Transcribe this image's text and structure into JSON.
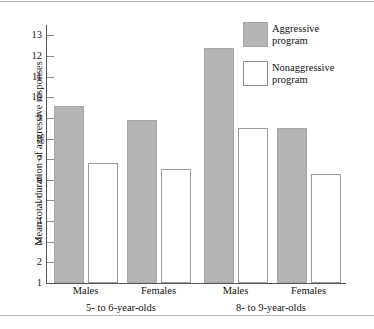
{
  "chart_data": {
    "type": "bar",
    "title": "",
    "xlabel": "",
    "ylabel": "Mean total duration of aggressive responses",
    "ylim": [
      1,
      13.5
    ],
    "yticks": [
      1,
      2,
      3,
      4,
      5,
      6,
      7,
      8,
      9,
      10,
      11,
      12,
      13
    ],
    "ytick_labels": [
      "1",
      "2",
      "3",
      "4",
      "5",
      "6",
      "7",
      "8",
      "9",
      "10",
      "11",
      "12",
      "13"
    ],
    "grid": false,
    "legend_position": "top-right",
    "categories": [
      "Males",
      "Females",
      "Males",
      "Females"
    ],
    "groups": [
      {
        "label": "5- to 6-year-olds",
        "categories": [
          "Males",
          "Females"
        ]
      },
      {
        "label": "8- to 9-year-olds",
        "categories": [
          "Males",
          "Females"
        ]
      }
    ],
    "series": [
      {
        "name": "Aggressive program",
        "color": "#b4b4b4",
        "values": [
          9.6,
          8.9,
          12.4,
          8.5
        ]
      },
      {
        "name": "Nonaggressive program",
        "color": "#ffffff",
        "values": [
          6.8,
          6.5,
          8.5,
          6.3
        ]
      }
    ]
  },
  "legend": {
    "items": [
      {
        "line1": "Aggressive",
        "line2": "program",
        "swatch": "filled-gray-swatch"
      },
      {
        "line1": "Nonaggressive",
        "line2": "program",
        "swatch": "outlined-white-swatch"
      }
    ]
  }
}
